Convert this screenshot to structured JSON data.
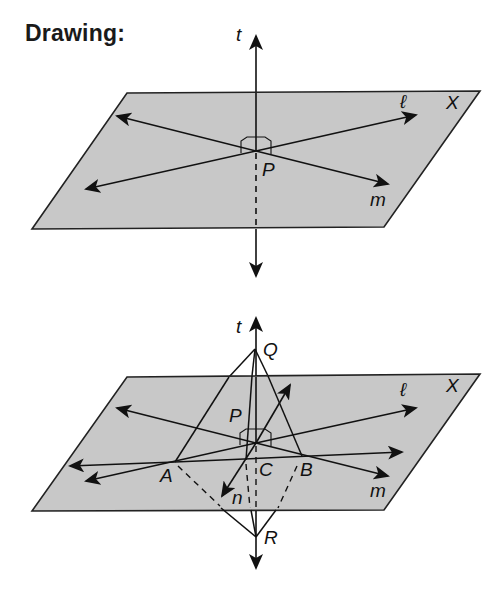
{
  "title": "Drawing:",
  "colors": {
    "plane_fill": "#c8c8c8",
    "line": "#111111",
    "background": "#ffffff"
  },
  "figure_top": {
    "plane_label": "X",
    "labels": {
      "t": "t",
      "l": "ℓ",
      "m": "m",
      "P": "P"
    }
  },
  "figure_bottom": {
    "plane_label": "X",
    "labels": {
      "t": "t",
      "Q": "Q",
      "P": "P",
      "l": "ℓ",
      "m": "m",
      "A": "A",
      "B": "B",
      "C": "C",
      "n": "n",
      "R": "R"
    }
  }
}
